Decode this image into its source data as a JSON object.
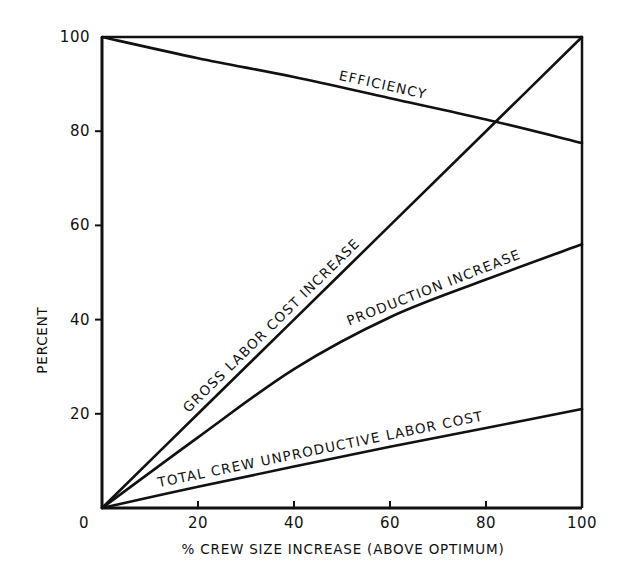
{
  "chart_data": {
    "type": "line",
    "title": "",
    "xlabel": "% CREW SIZE INCREASE (ABOVE OPTIMUM)",
    "ylabel": "PERCENT",
    "xlim": [
      0,
      100
    ],
    "ylim": [
      0,
      100
    ],
    "grid": false,
    "legend": "none (labels placed along lines)",
    "x_ticks": [
      0,
      20,
      40,
      60,
      80,
      100
    ],
    "y_ticks": [
      20,
      40,
      60,
      80,
      100
    ],
    "x_tick_labels": [
      "0",
      "20",
      "40",
      "60",
      "80",
      "100"
    ],
    "y_tick_labels": [
      "20",
      "40",
      "60",
      "80",
      "100"
    ],
    "x": [
      0,
      20,
      40,
      60,
      80,
      100
    ],
    "series": [
      {
        "name": "EFFICIENCY",
        "values": [
          100,
          95.5,
          91.5,
          87,
          82.5,
          77.5
        ]
      },
      {
        "name": "GROSS LABOR COST INCREASE",
        "values": [
          0,
          20,
          40,
          60,
          80,
          100
        ]
      },
      {
        "name": "PRODUCTION INCREASE",
        "values": [
          0,
          15,
          29.5,
          40.5,
          48.5,
          56
        ]
      },
      {
        "name": "TOTAL CREW UNPRODUCTIVE LABOR COST",
        "values": [
          0,
          4.5,
          8.8,
          13,
          17,
          21
        ]
      }
    ]
  }
}
